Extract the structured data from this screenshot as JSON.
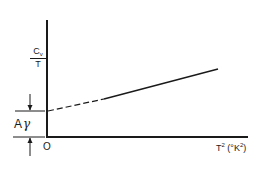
{
  "figure": {
    "y_axis_label": {
      "numerator": "C",
      "numerator_sub": "v",
      "denominator": "T"
    },
    "x_axis_label": {
      "base": "T",
      "base_sup": "2",
      "unit_open": " (°K",
      "unit_sup": "2",
      "unit_close": ")"
    },
    "origin_label": "O",
    "intercept_label": {
      "prefix": "A",
      "symbol": "γ"
    },
    "line": {
      "style_extrapolated": "dashed",
      "style_measured": "solid"
    },
    "colors": {
      "ink": "#1a1a1a",
      "background": "#ffffff"
    }
  }
}
